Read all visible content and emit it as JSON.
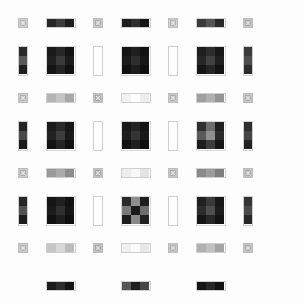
{
  "figure": {
    "width": 303,
    "height": 303,
    "background": "#fdfdfd",
    "margin": 8,
    "pitch": 37.5,
    "grid_rows": 7,
    "grid_cols": 7,
    "unit": 30,
    "gap": 7.5,
    "glyph_name": "x-mark-icon",
    "border_color": "#cfcfcf"
  },
  "palette": {
    "near_black": "#141414",
    "very_dark": "#1d1d1d",
    "dark": "#262626",
    "dark_mid": "#333333",
    "mid_dark": "#4a4a4a",
    "mid": "#6e6e6e",
    "mid_light": "#8f8f8f",
    "light": "#b4b4b4",
    "lighter": "#d2d2d2",
    "near_white": "#f2f2f2",
    "white": "#ffffff",
    "frame": "#cfcfcf"
  },
  "legend": {
    "block_label": "3x3 checker block",
    "hbar_label": "horizontal 3-segment bar",
    "vbar_label": "vertical 3-segment bar",
    "tile_label": "x-mark tile"
  },
  "chart_data": {
    "type": "heatmap",
    "xlabel": "",
    "ylabel": "",
    "grid": true,
    "legend_position": "none",
    "rows": 7,
    "cols": 7,
    "cell_types": [
      [
        "tile",
        "hbar",
        "tile",
        "hbar",
        "tile",
        "hbar",
        "tile"
      ],
      [
        "vbar",
        "blk",
        "vbar",
        "blk",
        "vbar",
        "blk",
        "vbar"
      ],
      [
        "tile",
        "hbar",
        "tile",
        "hbar",
        "tile",
        "hbar",
        "tile"
      ],
      [
        "vbar",
        "blk",
        "vbar",
        "blk",
        "vbar",
        "blk",
        "vbar"
      ],
      [
        "tile",
        "hbar",
        "tile",
        "hbar",
        "tile",
        "hbar",
        "tile"
      ],
      [
        "vbar",
        "blk",
        "vbar",
        "blk",
        "vbar",
        "blk",
        "vbar"
      ],
      [
        "tile",
        "hbar",
        "tile",
        "hbar",
        "tile",
        "hbar",
        "tile"
      ]
    ],
    "cells": [
      [
        {
          "type": "tile",
          "values": [
            "#d2d2d2"
          ]
        },
        {
          "type": "hbar",
          "values": [
            "#262626",
            "#3d3d3d",
            "#1d1d1d"
          ]
        },
        {
          "type": "tile",
          "values": [
            "#c8c8c8"
          ]
        },
        {
          "type": "hbar",
          "values": [
            "#1d1d1d",
            "#2e2e2e",
            "#141414"
          ]
        },
        {
          "type": "tile",
          "values": [
            "#cfcfcf"
          ]
        },
        {
          "type": "hbar",
          "values": [
            "#3a3a3a",
            "#555555",
            "#2a2a2a"
          ]
        },
        {
          "type": "tile",
          "values": [
            "#c4c4c4"
          ]
        }
      ],
      [
        {
          "type": "vbar",
          "values": [
            "#2a2a2a",
            "#5a5a5a",
            "#1f1f1f"
          ]
        },
        {
          "type": "blk",
          "values": [
            "#1a1a1a",
            "#262626",
            "#141414",
            "#202020",
            "#3a3a3a",
            "#1c1c1c",
            "#151515",
            "#242424",
            "#121212"
          ]
        },
        {
          "type": "vbar",
          "values": [
            "#ffffff",
            "#ffffff",
            "#ffffff"
          ]
        },
        {
          "type": "blk",
          "values": [
            "#141414",
            "#1f1f1f",
            "#121212",
            "#1b1b1b",
            "#2e2e2e",
            "#171717",
            "#101010",
            "#1d1d1d",
            "#0f0f0f"
          ]
        },
        {
          "type": "vbar",
          "values": [
            "#ffffff",
            "#ffffff",
            "#ffffff"
          ]
        },
        {
          "type": "blk",
          "values": [
            "#1e1e1e",
            "#2c2c2c",
            "#181818",
            "#282828",
            "#424242",
            "#1f1f1f",
            "#161616",
            "#262626",
            "#141414"
          ]
        },
        {
          "type": "vbar",
          "values": [
            "#3a3a3a",
            "#4e4e4e",
            "#2c2c2c"
          ]
        }
      ],
      [
        {
          "type": "tile",
          "values": [
            "#cccccc"
          ]
        },
        {
          "type": "hbar",
          "values": [
            "#b4b4b4",
            "#c4c4c4",
            "#a8a8a8"
          ]
        },
        {
          "type": "tile",
          "values": [
            "#c2c2c2"
          ]
        },
        {
          "type": "hbar",
          "values": [
            "#f2f2f2",
            "#ffffff",
            "#ededed"
          ]
        },
        {
          "type": "tile",
          "values": [
            "#cacaca"
          ]
        },
        {
          "type": "hbar",
          "values": [
            "#a0a0a0",
            "#b0b0b0",
            "#949494"
          ]
        },
        {
          "type": "tile",
          "values": [
            "#c6c6c6"
          ]
        }
      ],
      [
        {
          "type": "vbar",
          "values": [
            "#232323",
            "#4a4a4a",
            "#1b1b1b"
          ]
        },
        {
          "type": "blk",
          "values": [
            "#1c1c1c",
            "#292929",
            "#161616",
            "#222222",
            "#3d3d3d",
            "#1a1a1a",
            "#141414",
            "#252525",
            "#121212"
          ]
        },
        {
          "type": "vbar",
          "values": [
            "#ffffff",
            "#ffffff",
            "#ffffff"
          ]
        },
        {
          "type": "blk",
          "values": [
            "#181818",
            "#242424",
            "#131313",
            "#1e1e1e",
            "#343434",
            "#191919",
            "#121212",
            "#202020",
            "#101010"
          ]
        },
        {
          "type": "vbar",
          "values": [
            "#ffffff",
            "#ffffff",
            "#ffffff"
          ]
        },
        {
          "type": "blk",
          "values": [
            "#303030",
            "#6e6e6e",
            "#1f1f1f",
            "#5a5a5a",
            "#8f8f8f",
            "#2a2a2a",
            "#1d1d1d",
            "#3c3c3c",
            "#161616"
          ]
        },
        {
          "type": "vbar",
          "values": [
            "#2e2e2e",
            "#454545",
            "#222222"
          ]
        }
      ],
      [
        {
          "type": "tile",
          "values": [
            "#c9c9c9"
          ]
        },
        {
          "type": "hbar",
          "values": [
            "#9a9a9a",
            "#ababab",
            "#8d8d8d"
          ]
        },
        {
          "type": "tile",
          "values": [
            "#c0c0c0"
          ]
        },
        {
          "type": "hbar",
          "values": [
            "#ededed",
            "#f8f8f8",
            "#e4e4e4"
          ]
        },
        {
          "type": "tile",
          "values": [
            "#c7c7c7"
          ]
        },
        {
          "type": "hbar",
          "values": [
            "#8a8a8a",
            "#9c9c9c",
            "#7e7e7e"
          ]
        },
        {
          "type": "tile",
          "values": [
            "#c3c3c3"
          ]
        }
      ],
      [
        {
          "type": "vbar",
          "values": [
            "#262626",
            "#525252",
            "#1d1d1d"
          ]
        },
        {
          "type": "blk",
          "values": [
            "#151515",
            "#202020",
            "#121212",
            "#1b1b1b",
            "#2f2f2f",
            "#161616",
            "#111111",
            "#1e1e1e",
            "#0f0f0f"
          ]
        },
        {
          "type": "vbar",
          "values": [
            "#ffffff",
            "#ffffff",
            "#ffffff"
          ]
        },
        {
          "type": "blk",
          "values": [
            "#2a2a2a",
            "#8f8f8f",
            "#1e1e1e",
            "#7a7a7a",
            "#1a1a1a",
            "#6e6e6e",
            "#1d1d1d",
            "#8a8a8a",
            "#222222"
          ]
        },
        {
          "type": "vbar",
          "values": [
            "#ffffff",
            "#ffffff",
            "#ffffff"
          ]
        },
        {
          "type": "blk",
          "values": [
            "#202020",
            "#3a3a3a",
            "#171717",
            "#2c2c2c",
            "#4e4e4e",
            "#1d1d1d",
            "#151515",
            "#282828",
            "#131313"
          ]
        },
        {
          "type": "vbar",
          "values": [
            "#343434",
            "#4a4a4a",
            "#272727"
          ]
        }
      ],
      [
        {
          "type": "tile",
          "values": [
            "#cdcdcd"
          ]
        },
        {
          "type": "hbar",
          "values": [
            "#c6c6c6",
            "#d8d8d8",
            "#bcbcbc"
          ]
        },
        {
          "type": "tile",
          "values": [
            "#c1c1c1"
          ]
        },
        {
          "type": "hbar",
          "values": [
            "#f0f0f0",
            "#fbfbfb",
            "#e8e8e8"
          ]
        },
        {
          "type": "tile",
          "values": [
            "#c8c8c8"
          ]
        },
        {
          "type": "hbar",
          "values": [
            "#b0b0b0",
            "#c0c0c0",
            "#a4a4a4"
          ]
        },
        {
          "type": "tile",
          "values": [
            "#c5c5c5"
          ]
        }
      ],
      [
        {
          "type": "hbar",
          "values": [
            "#1f1f1f",
            "#2e2e2e",
            "#161616"
          ]
        },
        {
          "type": "hbar",
          "values": [
            "#5a5a5a",
            "#1d1d1d",
            "#4a4a4a"
          ]
        },
        {
          "type": "hbar",
          "values": [
            "#141414",
            "#242424",
            "#111111"
          ]
        }
      ]
    ],
    "bottom_row": [
      {
        "type": "hbar",
        "values": [
          "#1d1d1d",
          "#2c2c2c",
          "#151515"
        ]
      },
      {
        "type": "hbar",
        "values": [
          "#555555",
          "#1e1e1e",
          "#464646"
        ]
      },
      {
        "type": "hbar",
        "values": [
          "#161616",
          "#262626",
          "#121212"
        ]
      }
    ]
  }
}
